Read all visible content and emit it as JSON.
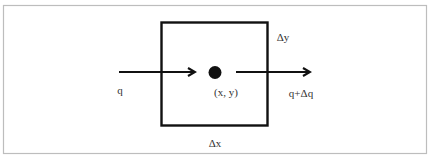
{
  "diagram": {
    "labels": {
      "flux_in": "q",
      "point": "(x, y)",
      "flux_out": "q+Δq",
      "height": "Δy",
      "width": "Δx"
    },
    "colors": {
      "frame": "#bdbdbd",
      "stroke": "#111111",
      "text": "#333333",
      "background": "#ffffff"
    }
  }
}
